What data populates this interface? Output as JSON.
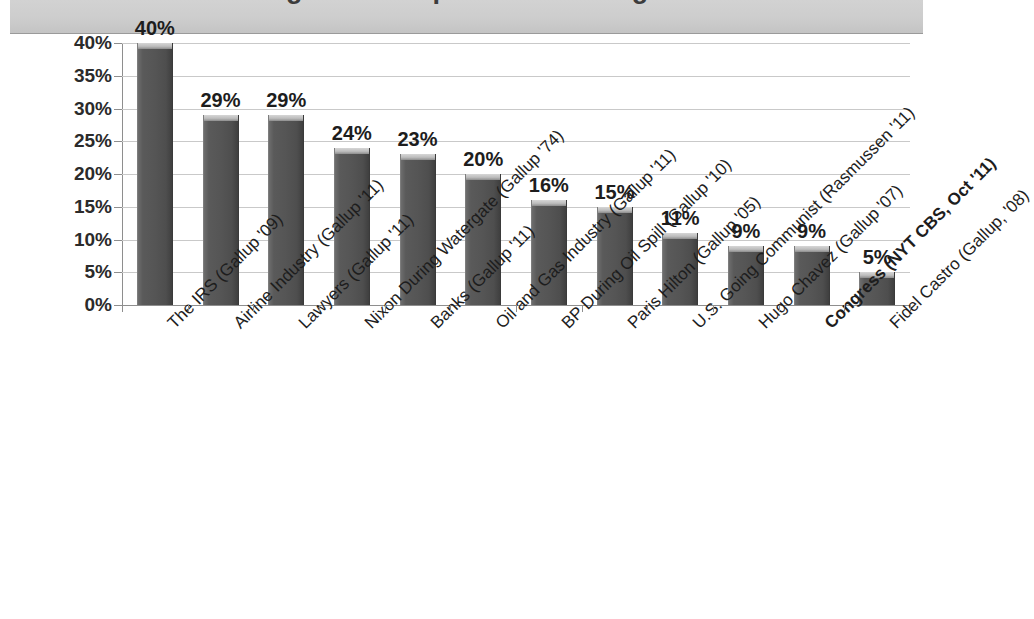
{
  "title": {
    "text": "Things More Popular Than Congress",
    "visible_note": "cut off at top of image"
  },
  "chart_data": {
    "type": "bar",
    "title": "Things More Popular Than Congress",
    "xlabel": "",
    "ylabel": "",
    "ylim": [
      0,
      40
    ],
    "ytick_labels": [
      "40%",
      "35%",
      "30%",
      "25%",
      "20%",
      "15%",
      "10%",
      "5%",
      "0%"
    ],
    "ytick_values": [
      40,
      35,
      30,
      25,
      20,
      15,
      10,
      5,
      0
    ],
    "grid": true,
    "legend": false,
    "bar_color": "#555555",
    "bar_cap_color": "#bdbdbd",
    "categories": [
      "The IRS (Gallup '09)",
      "Airline Industry (Gallup '11)",
      "Lawyers (Gallup '11)",
      "Nixon During Watergate (Gallup '74)",
      "Banks (Gallup '11)",
      "Oil and Gas Industry (Gallup '11)",
      "BP During Oil Spill (Gallup '10)",
      "Paris Hilton (Gallup '05)",
      "U.S. Going Communist (Rasmussen '11)",
      "Hugo Chavez (Gallup '07)",
      "Congress (NYT CBS, Oct '11)",
      "Fidel Castro (Gallup, '08)"
    ],
    "values": [
      40,
      29,
      29,
      24,
      23,
      20,
      16,
      15,
      11,
      9,
      9,
      5
    ],
    "data_labels": [
      "40%",
      "29%",
      "29%",
      "24%",
      "23%",
      "20%",
      "16%",
      "15%",
      "11%",
      "9%",
      "9%",
      "5%"
    ],
    "highlighted_category_index": 10
  }
}
